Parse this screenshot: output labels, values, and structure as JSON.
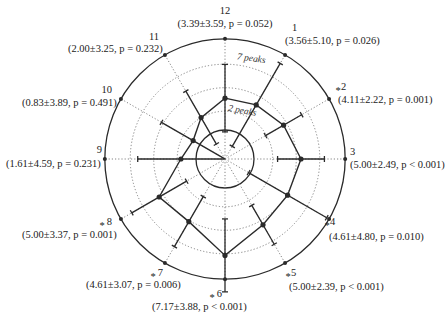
{
  "chart_data": {
    "type": "polar-line",
    "title": "",
    "directions": [
      {
        "num": "12",
        "angle_deg": 0,
        "mean": 3.39,
        "sd": 3.59,
        "p": "p = 0.052",
        "text": "(3.39±3.59, p = 0.052)",
        "significant": false
      },
      {
        "num": "1",
        "angle_deg": 30,
        "mean": 3.56,
        "sd": 5.1,
        "p": "p = 0.026",
        "text": "(3.56±5.10, p = 0.026)",
        "significant": false
      },
      {
        "num": "2",
        "angle_deg": 60,
        "mean": 4.11,
        "sd": 2.22,
        "p": "p = 0.001",
        "text": "(4.11±2.22, p = 0.001)",
        "significant": true
      },
      {
        "num": "3",
        "angle_deg": 90,
        "mean": 5.0,
        "sd": 2.49,
        "p": "p < 0.001",
        "text": "(5.00±2.49, p < 0.001)",
        "significant": false
      },
      {
        "num": "4",
        "angle_deg": 120,
        "mean": 4.61,
        "sd": 4.8,
        "p": "p = 0.010",
        "text": "(4.61±4.80, p = 0.010)",
        "significant": true
      },
      {
        "num": "5",
        "angle_deg": 150,
        "mean": 5.0,
        "sd": 2.39,
        "p": "p < 0.001",
        "text": "(5.00±2.39, p < 0.001)",
        "significant": true
      },
      {
        "num": "6",
        "angle_deg": 180,
        "mean": 7.17,
        "sd": 3.88,
        "p": "p < 0.001",
        "text": "(7.17±3.88, p < 0.001)",
        "significant": true
      },
      {
        "num": "7",
        "angle_deg": 210,
        "mean": 4.61,
        "sd": 3.07,
        "p": "p = 0.006",
        "text": "(4.61±3.07, p = 0.006)",
        "significant": true
      },
      {
        "num": "8",
        "angle_deg": 240,
        "mean": 5.0,
        "sd": 3.37,
        "p": "p = 0.001",
        "text": "(5.00±3.37, p = 0.001)",
        "significant": true
      },
      {
        "num": "9",
        "angle_deg": 270,
        "mean": 1.61,
        "sd": 4.59,
        "p": "p = 0.231",
        "text": "(1.61±4.59, p = 0.231)",
        "significant": false
      },
      {
        "num": "10",
        "angle_deg": 300,
        "mean": 0.83,
        "sd": 3.89,
        "p": "p = 0.491",
        "text": "(0.83±3.89, p = 0.491)",
        "significant": false
      },
      {
        "num": "11",
        "angle_deg": 330,
        "mean": 2.0,
        "sd": 3.25,
        "p": "p = 0.232",
        "text": "(2.00±3.25, p = 0.232)",
        "significant": false
      }
    ],
    "rings": [
      {
        "value": 0,
        "style": "solid"
      },
      {
        "value": 2,
        "style": "dotted",
        "label": "2 peaks"
      },
      {
        "value": 4.5,
        "style": "dotted"
      },
      {
        "value": 7,
        "style": "dotted",
        "label": "7 peaks"
      },
      {
        "value": 9.7,
        "style": "solid"
      }
    ],
    "ring_labels": [
      "2 peaks",
      "7 peaks"
    ],
    "center": {
      "x": 225,
      "y": 159
    },
    "scale": {
      "r0": 29,
      "px_per_unit": 9.4
    },
    "legend": "none"
  },
  "colors": {
    "line": "#2a2a2a",
    "grid": "#777777",
    "text": "#222222",
    "background": "#ffffff"
  }
}
